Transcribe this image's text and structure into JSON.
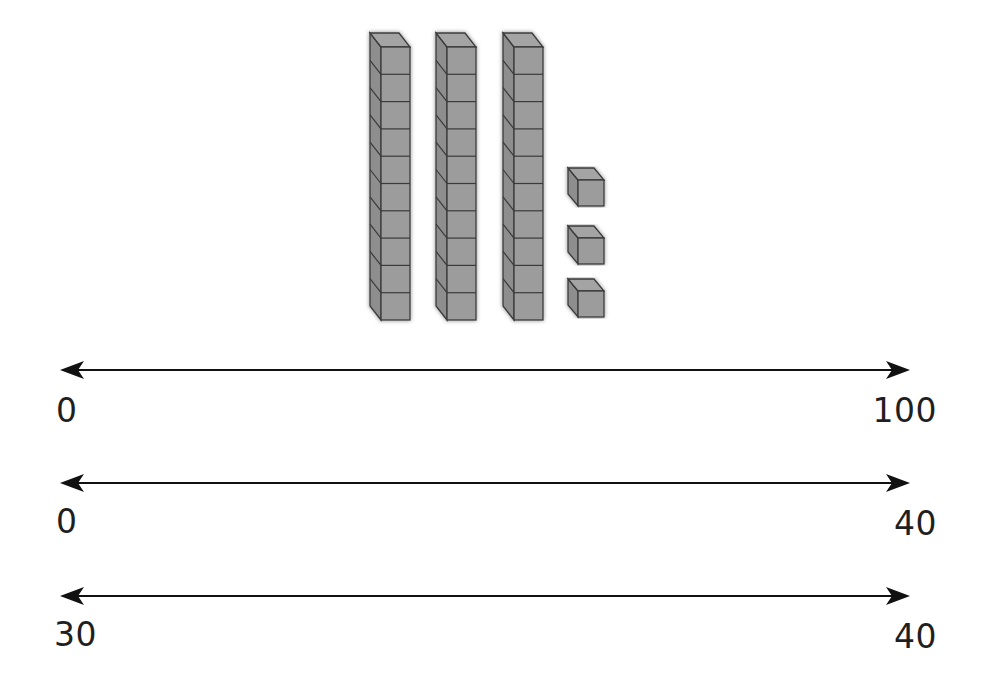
{
  "base_ten_blocks": {
    "tens_rods": 3,
    "cubes_per_rod": 10,
    "ones_cubes": 3,
    "represented_value": 33,
    "fill_color": "#9a9a9a",
    "edge_color": "#3a3a3a",
    "shadow_color": "#8c8c8c"
  },
  "number_lines": [
    {
      "start_label": "0",
      "end_label": "100"
    },
    {
      "start_label": "0",
      "end_label": "40"
    },
    {
      "start_label": "30",
      "end_label": "40"
    }
  ],
  "line_color": "#111111"
}
